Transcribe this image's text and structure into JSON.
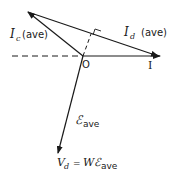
{
  "diagram": {
    "type": "phasor-diagram",
    "origin_label": "O",
    "reference_label": "I",
    "vectors": [
      {
        "name": "I_c (ave)",
        "symbol": "I",
        "subscript": "c",
        "suffix": "(ave)"
      },
      {
        "name": "I_d (ave)",
        "symbol": "I",
        "subscript": "d",
        "suffix": "(ave)"
      },
      {
        "name": "E_ave",
        "symbol": "ℰ",
        "subscript": "ave"
      }
    ],
    "equation": {
      "lhs": "V",
      "lhs_sub": "d",
      "eq": "=",
      "rhs": "Wℰ",
      "rhs_sub": "ave"
    },
    "colors": {
      "line": "#1a1a1a",
      "background": "#ffffff"
    }
  },
  "labels": {
    "ic_sym": "I",
    "ic_sub": "c",
    "ic_suffix": "(ave)",
    "id_sym": "I",
    "id_sub": "d",
    "id_suffix": "(ave)",
    "origin": "O",
    "ref": "I",
    "e_sym": "ℰ",
    "e_sub": "ave",
    "vd_sym": "V",
    "vd_sub": "d",
    "vd_eq": "=",
    "vd_rhs": "Wℰ",
    "vd_rhs_sub": "ave"
  }
}
